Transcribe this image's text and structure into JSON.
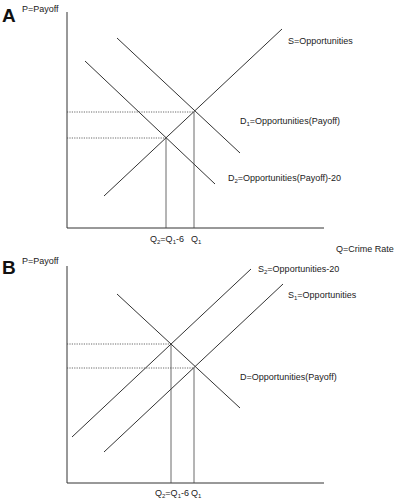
{
  "panels": [
    {
      "letter": "A",
      "y_axis_label": "P=Payoff",
      "x_axis_label": "Q=Crime Rate",
      "curves": [
        {
          "id": "S",
          "label_main": "S=Opportunities",
          "sub": "",
          "label_rest": ""
        },
        {
          "id": "D1",
          "label_main": "D",
          "sub": "1",
          "label_rest": "=Opportunities(Payoff)"
        },
        {
          "id": "D2",
          "label_main": "D",
          "sub": "2",
          "label_rest": "=Opportunities(Payoff)-20"
        }
      ],
      "ticks": [
        {
          "main": "Q",
          "sub": "2",
          "mid": "=Q",
          "sub2": "1",
          "rest": "-6"
        },
        {
          "main": "Q",
          "sub": "1",
          "mid": "",
          "sub2": "",
          "rest": ""
        }
      ]
    },
    {
      "letter": "B",
      "y_axis_label": "P=Payoff",
      "x_axis_label": "",
      "curves": [
        {
          "id": "S2",
          "label_main": "S",
          "sub": "2",
          "label_rest": "=Opportunities-20"
        },
        {
          "id": "S1",
          "label_main": "S",
          "sub": "1",
          "label_rest": "=Opportunities"
        },
        {
          "id": "D",
          "label_main": "D=Opportunities(Payoff)",
          "sub": "",
          "label_rest": ""
        }
      ],
      "ticks": [
        {
          "main": "Q",
          "sub": "2",
          "mid": "=Q",
          "sub2": "1",
          "rest": "-6"
        },
        {
          "main": "Q",
          "sub": "1",
          "mid": "",
          "sub2": "",
          "rest": ""
        }
      ]
    }
  ]
}
